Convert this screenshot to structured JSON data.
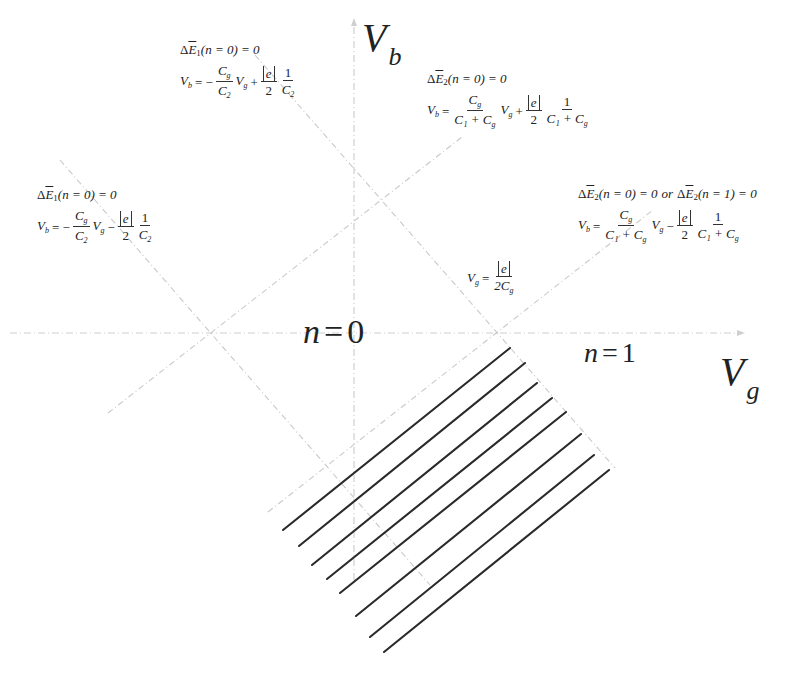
{
  "figure": {
    "type": "stability-diagram",
    "colors": {
      "background": "#ffffff",
      "guide_lines": "#c9c9c9",
      "hatch_lines": "#2a2a2a",
      "text": "#222222"
    }
  },
  "axes": {
    "vertical": {
      "symbol": "V",
      "subscript": "b"
    },
    "horizontal": {
      "symbol": "V",
      "subscript": "g"
    }
  },
  "regions": [
    {
      "id": "n0",
      "var": "n",
      "eq": "=",
      "value": "0"
    },
    {
      "id": "n1",
      "var": "n",
      "eq": "=",
      "value": "1"
    }
  ],
  "equations": {
    "top_left": {
      "condition": {
        "delta": "Δ",
        "E": "E",
        "index": "1",
        "arg": "(n = 0) = 0"
      },
      "lhs": "V",
      "lhs_sub": "b",
      "sign1": "= −",
      "frac1_num": "C",
      "frac1_num_sub": "g",
      "frac1_den": "C",
      "frac1_den_sub": "2",
      "var": "V",
      "var_sub": "g",
      "sign2": "+",
      "abs_e": "e",
      "half_den": "2",
      "frac2_num": "1",
      "frac2_den": "C",
      "frac2_den_sub": "2"
    },
    "bottom_left": {
      "condition": {
        "delta": "Δ",
        "E": "E",
        "index": "1",
        "arg": "(n = 0) = 0"
      },
      "lhs": "V",
      "lhs_sub": "b",
      "sign1": "= −",
      "frac1_num": "C",
      "frac1_num_sub": "g",
      "frac1_den": "C",
      "frac1_den_sub": "2",
      "var": "V",
      "var_sub": "g",
      "sign2": "−",
      "abs_e": "e",
      "half_den": "2",
      "frac2_num": "1",
      "frac2_den": "C",
      "frac2_den_sub": "2"
    },
    "top_right": {
      "condition": {
        "delta": "Δ",
        "E": "E",
        "index": "2",
        "arg": "(n = 0) = 0"
      },
      "lhs": "V",
      "lhs_sub": "b",
      "sign1": "=",
      "frac1_num": "C",
      "frac1_num_sub": "g",
      "frac1_den": "C₁ + C",
      "frac1_den_sub": "g",
      "var": "V",
      "var_sub": "g",
      "sign2": "+",
      "abs_e": "e",
      "half_den": "2",
      "frac2_num": "1",
      "frac2_den": "C₁ + C",
      "frac2_den_sub": "g"
    },
    "bottom_right": {
      "condition": {
        "delta": "Δ",
        "E": "E",
        "index": "2",
        "arg": "(n = 0) = 0",
        "or": "or",
        "arg2": "(n = 1) = 0"
      },
      "lhs": "V",
      "lhs_sub": "b",
      "sign1": "=",
      "frac1_num": "C",
      "frac1_num_sub": "g",
      "frac1_den": "C₁ + C",
      "frac1_den_sub": "g",
      "var": "V",
      "var_sub": "g",
      "sign2": "−",
      "abs_e": "e",
      "half_den": "2",
      "frac2_num": "1",
      "frac2_den": "C₁ + C",
      "frac2_den_sub": "g"
    },
    "gate_threshold": {
      "lhs": "V",
      "lhs_sub": "g",
      "sign": "=",
      "num_abs_e": "e",
      "den": "2C",
      "den_sub": "g"
    }
  },
  "geometry": {
    "vertical_axis": {
      "x": 354,
      "y_top": 18,
      "y_bottom": 580
    },
    "horizontal_axis": {
      "y": 333,
      "x_left": 10,
      "x_right": 745
    },
    "diamond": {
      "top": [
        382,
        200
      ],
      "left": [
        211,
        333
      ],
      "right": [
        497,
        333
      ],
      "bottom": [
        328,
        467
      ]
    },
    "guide_lines": [
      {
        "from": [
          255,
          55
        ],
        "to": [
          615,
          468
        ]
      },
      {
        "from": [
          60,
          160
        ],
        "to": [
          430,
          585
        ]
      },
      {
        "from": [
          108,
          413
        ],
        "to": [
          462,
          137
        ]
      },
      {
        "from": [
          268,
          512
        ],
        "to": [
          653,
          210
        ]
      }
    ],
    "hatch_lines": [
      {
        "from": [
          283,
          530
        ],
        "to": [
          510,
          348
        ]
      },
      {
        "from": [
          299,
          546
        ],
        "to": [
          525,
          363
        ]
      },
      {
        "from": [
          312,
          565
        ],
        "to": [
          537,
          383
        ]
      },
      {
        "from": [
          327,
          579
        ],
        "to": [
          552,
          398
        ]
      },
      {
        "from": [
          340,
          593
        ],
        "to": [
          566,
          412
        ]
      },
      {
        "from": [
          356,
          616
        ],
        "to": [
          581,
          434
        ]
      },
      {
        "from": [
          370,
          637
        ],
        "to": [
          594,
          455
        ]
      },
      {
        "from": [
          384,
          652
        ],
        "to": [
          609,
          470
        ]
      }
    ]
  }
}
